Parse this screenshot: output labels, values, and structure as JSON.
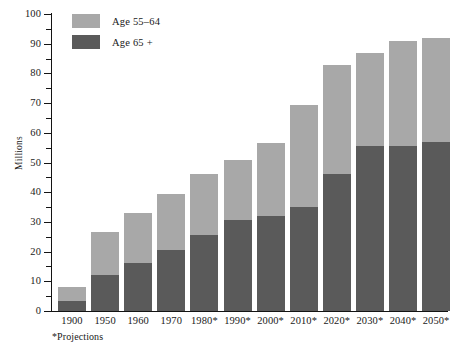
{
  "chart_data": {
    "type": "bar",
    "subtype": "stacked-bar",
    "title": "",
    "xlabel": "",
    "ylabel": "Millions",
    "ylim": [
      0,
      100
    ],
    "ytick_step": 10,
    "yminor_step": 5,
    "grid": false,
    "legend_position": "top-left",
    "categories": [
      "1900",
      "1950",
      "1960",
      "1970",
      "1980*",
      "1990*",
      "2000*",
      "2010*",
      "2020*",
      "2030*",
      "2040*",
      "2050*"
    ],
    "series": [
      {
        "name": "Age 65 +",
        "color": "#5a5a5a",
        "values": [
          3.5,
          12.0,
          16.0,
          20.5,
          25.5,
          30.5,
          32.0,
          35.0,
          46.0,
          55.5,
          55.5,
          57.0
        ]
      },
      {
        "name": "Age 55–64",
        "color": "#a8a8a8",
        "values": [
          4.5,
          14.5,
          17.0,
          19.0,
          20.5,
          20.5,
          24.5,
          34.5,
          37.0,
          31.5,
          35.5,
          35.0
        ]
      }
    ],
    "totals": [
      8.0,
      26.5,
      33.0,
      39.5,
      46.0,
      51.0,
      56.5,
      69.5,
      83.0,
      87.0,
      91.0,
      92.0
    ],
    "ytick_labels": [
      "0",
      "10",
      "20",
      "30",
      "40",
      "50",
      "60",
      "70",
      "80",
      "90",
      "100"
    ],
    "annotations": [
      "*Projections"
    ]
  },
  "legend": {
    "items": [
      {
        "label": "Age 55–64",
        "color": "#a8a8a8"
      },
      {
        "label": "Age 65 +",
        "color": "#5a5a5a"
      }
    ]
  },
  "axes": {
    "y_title": "Millions"
  },
  "footnote": {
    "text": "*Projections"
  },
  "colors": {
    "background": "#ffffff",
    "axis": "#141414",
    "text": "#1a1a1a",
    "series_55_64": "#a8a8a8",
    "series_65_plus": "#5a5a5a"
  }
}
